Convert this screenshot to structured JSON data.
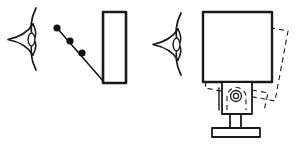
{
  "figure": {
    "title": "Eye viewing flat panel and rotating monitor diagram",
    "background_color": "#ffffff",
    "stroke_color": "#1a1a1a",
    "width": 297,
    "height": 145
  },
  "panels": {
    "left": {
      "name": "eye-viewing-dots-and-panel",
      "eye": {
        "label": "eye-left",
        "description": "stylized eye in profile with lens-shaped pupil pointing left",
        "cx": 22,
        "cy": 40,
        "pupil_cx": 30,
        "pupil_cy": 40
      },
      "dots": {
        "label": "sight-line-dots",
        "count": 3,
        "radius": 3.6,
        "points": [
          {
            "x": 57,
            "y": 28
          },
          {
            "x": 70,
            "y": 41
          },
          {
            "x": 82,
            "y": 53
          }
        ]
      },
      "sight_line": {
        "label": "sight-line",
        "from": {
          "x": 57,
          "y": 28
        },
        "to": {
          "x": 104,
          "y": 82
        }
      },
      "panel": {
        "label": "flat-panel-rectangle",
        "x": 103,
        "y": 12,
        "width": 23,
        "height": 71,
        "stroke_width": 2.6
      }
    },
    "right": {
      "name": "eye-viewing-rotating-monitor",
      "eye": {
        "label": "eye-right",
        "description": "stylized eye in profile with lens-shaped pupil pointing left",
        "cx": 167,
        "cy": 45,
        "pupil_cx": 175,
        "pupil_cy": 45
      },
      "screen_solid": {
        "label": "monitor-screen-solid",
        "x": 203,
        "y": 12,
        "width": 69,
        "height": 70,
        "stroke_width": 2.4
      },
      "screen_dashed": {
        "label": "monitor-screen-rotated-dashed",
        "rotation_degrees": 11,
        "points": [
          {
            "x": 217,
            "y": 18
          },
          {
            "x": 288,
            "y": 31
          },
          {
            "x": 275,
            "y": 101
          },
          {
            "x": 205,
            "y": 88
          }
        ]
      },
      "neck": {
        "label": "monitor-neck-housing",
        "x": 222,
        "y": 82,
        "width": 30,
        "height": 32,
        "stroke_width": 1.8
      },
      "pivot": {
        "label": "swivel-pivot-indicator",
        "cx": 236,
        "cy": 96,
        "outer_radius": 5.5,
        "inner_radius": 2.6
      },
      "neck_dashed_arch": {
        "label": "neck-rotated-arch-dashed",
        "description": "dashed dome arch showing rotated neck housing"
      },
      "post": {
        "label": "monitor-stand-post",
        "x": 230,
        "y": 114,
        "width": 11,
        "height": 15,
        "stroke_width": 1.8
      },
      "base": {
        "label": "monitor-stand-base",
        "x": 212,
        "y": 128,
        "width": 48,
        "height": 9,
        "stroke_width": 1.8
      }
    }
  },
  "chart_data": {
    "type": "diagram",
    "title": "Eye viewing flat panel and rotating monitor",
    "elements": [
      "eye-left",
      "sight-line-dots",
      "flat-panel-rectangle",
      "eye-right",
      "monitor-screen-solid",
      "monitor-screen-rotated-dashed",
      "monitor-neck-housing",
      "monitor-stand-post",
      "monitor-stand-base"
    ]
  }
}
